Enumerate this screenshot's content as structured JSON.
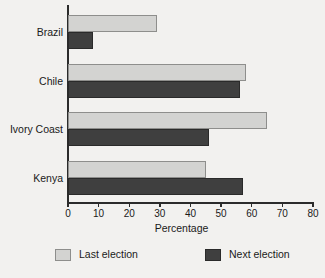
{
  "chart_data": {
    "type": "bar",
    "orientation": "horizontal",
    "title": "",
    "xlabel": "Percentage",
    "ylabel": "",
    "xlim": [
      0,
      80
    ],
    "xticks": [
      0,
      10,
      20,
      30,
      40,
      50,
      60,
      70,
      80
    ],
    "grid": false,
    "legend_position": "bottom",
    "categories": [
      "Brazil",
      "Chile",
      "Ivory Coast",
      "Kenya"
    ],
    "series": [
      {
        "name": "Last election",
        "color": "#d3d3d1",
        "values": [
          29,
          58,
          65,
          45
        ]
      },
      {
        "name": "Next election",
        "color": "#3f3f3f",
        "values": [
          8,
          56,
          46,
          57
        ]
      }
    ]
  },
  "legend": {
    "items": [
      {
        "label": "Last election",
        "swatch": "light-gray-swatch"
      },
      {
        "label": "Next election",
        "swatch": "dark-gray-swatch"
      }
    ]
  },
  "axis": {
    "x_title": "Percentage",
    "tick_labels": [
      "0",
      "10",
      "20",
      "30",
      "40",
      "50",
      "60",
      "70",
      "80"
    ]
  },
  "colors": {
    "background": "#f2f1ef",
    "axis": "#2b2b2b",
    "series_last": "#d3d3d1",
    "series_next": "#3f3f3f",
    "text": "#1a1a1a"
  }
}
